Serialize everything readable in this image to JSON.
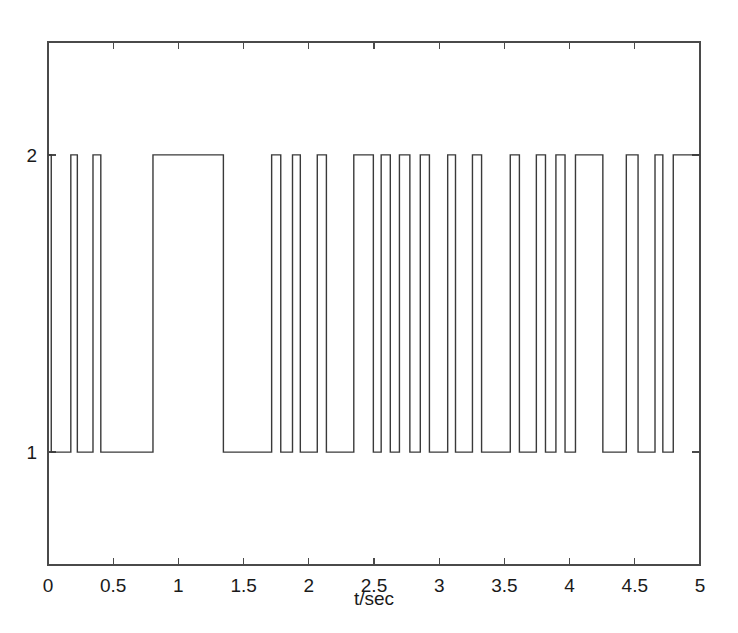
{
  "figure": {
    "background_color": "#ffffff",
    "line_color": "#3a3a3a",
    "axis_color": "#4a4a4a"
  },
  "chart_data": {
    "type": "line",
    "title": "",
    "subtitle": "",
    "xlabel": "t/sec",
    "ylabel": "",
    "xlim": [
      0,
      5
    ],
    "ylim": [
      0.62,
      2.38
    ],
    "grid": false,
    "legend": null,
    "annotations": [],
    "x_ticks": [
      0,
      0.5,
      1,
      1.5,
      2,
      2.5,
      3,
      3.5,
      4,
      4.5,
      5
    ],
    "x_tick_labels": [
      "0",
      "0.5",
      "1",
      "1.5",
      "2",
      "2.5",
      "3",
      "3.5",
      "4",
      "4.5",
      "5"
    ],
    "y_ticks": [
      1,
      2
    ],
    "y_tick_labels": [
      "1",
      "2"
    ],
    "levels": {
      "low": 1,
      "high": 2
    },
    "series": [
      {
        "name": "binary signal",
        "style": "step",
        "color": "#3a3a3a",
        "start_level": 2,
        "transitions": [
          0.025,
          0.175,
          0.225,
          0.345,
          0.405,
          0.805,
          1.345,
          1.715,
          1.785,
          1.875,
          1.935,
          2.065,
          2.135,
          2.345,
          2.495,
          2.555,
          2.625,
          2.695,
          2.775,
          2.855,
          2.925,
          3.065,
          3.125,
          3.255,
          3.325,
          3.545,
          3.615,
          3.745,
          3.815,
          3.895,
          3.965,
          4.045,
          4.255,
          4.435,
          4.525,
          4.655,
          4.715,
          4.795
        ],
        "segments": [
          {
            "t_start": 0.0,
            "t_end": 0.025,
            "level": 2
          },
          {
            "t_start": 0.025,
            "t_end": 0.175,
            "level": 1
          },
          {
            "t_start": 0.175,
            "t_end": 0.225,
            "level": 2
          },
          {
            "t_start": 0.225,
            "t_end": 0.345,
            "level": 1
          },
          {
            "t_start": 0.345,
            "t_end": 0.405,
            "level": 2
          },
          {
            "t_start": 0.405,
            "t_end": 0.805,
            "level": 1
          },
          {
            "t_start": 0.805,
            "t_end": 1.345,
            "level": 2
          },
          {
            "t_start": 1.345,
            "t_end": 1.715,
            "level": 1
          },
          {
            "t_start": 1.715,
            "t_end": 1.785,
            "level": 2
          },
          {
            "t_start": 1.785,
            "t_end": 1.875,
            "level": 1
          },
          {
            "t_start": 1.875,
            "t_end": 1.935,
            "level": 2
          },
          {
            "t_start": 1.935,
            "t_end": 2.065,
            "level": 1
          },
          {
            "t_start": 2.065,
            "t_end": 2.135,
            "level": 2
          },
          {
            "t_start": 2.135,
            "t_end": 2.345,
            "level": 1
          },
          {
            "t_start": 2.345,
            "t_end": 2.495,
            "level": 2
          },
          {
            "t_start": 2.495,
            "t_end": 2.555,
            "level": 1
          },
          {
            "t_start": 2.555,
            "t_end": 2.625,
            "level": 2
          },
          {
            "t_start": 2.625,
            "t_end": 2.695,
            "level": 1
          },
          {
            "t_start": 2.695,
            "t_end": 2.775,
            "level": 2
          },
          {
            "t_start": 2.775,
            "t_end": 2.855,
            "level": 1
          },
          {
            "t_start": 2.855,
            "t_end": 2.925,
            "level": 2
          },
          {
            "t_start": 2.925,
            "t_end": 3.065,
            "level": 1
          },
          {
            "t_start": 3.065,
            "t_end": 3.125,
            "level": 2
          },
          {
            "t_start": 3.125,
            "t_end": 3.255,
            "level": 1
          },
          {
            "t_start": 3.255,
            "t_end": 3.325,
            "level": 2
          },
          {
            "t_start": 3.325,
            "t_end": 3.545,
            "level": 1
          },
          {
            "t_start": 3.545,
            "t_end": 3.615,
            "level": 2
          },
          {
            "t_start": 3.615,
            "t_end": 3.745,
            "level": 1
          },
          {
            "t_start": 3.745,
            "t_end": 3.815,
            "level": 2
          },
          {
            "t_start": 3.815,
            "t_end": 3.895,
            "level": 1
          },
          {
            "t_start": 3.895,
            "t_end": 3.965,
            "level": 2
          },
          {
            "t_start": 3.965,
            "t_end": 4.045,
            "level": 1
          },
          {
            "t_start": 4.045,
            "t_end": 4.255,
            "level": 2
          },
          {
            "t_start": 4.255,
            "t_end": 4.435,
            "level": 1
          },
          {
            "t_start": 4.435,
            "t_end": 4.525,
            "level": 2
          },
          {
            "t_start": 4.525,
            "t_end": 4.655,
            "level": 1
          },
          {
            "t_start": 4.655,
            "t_end": 4.715,
            "level": 2
          },
          {
            "t_start": 4.715,
            "t_end": 4.795,
            "level": 1
          },
          {
            "t_start": 4.795,
            "t_end": 5.0,
            "level": 2
          }
        ]
      }
    ]
  }
}
